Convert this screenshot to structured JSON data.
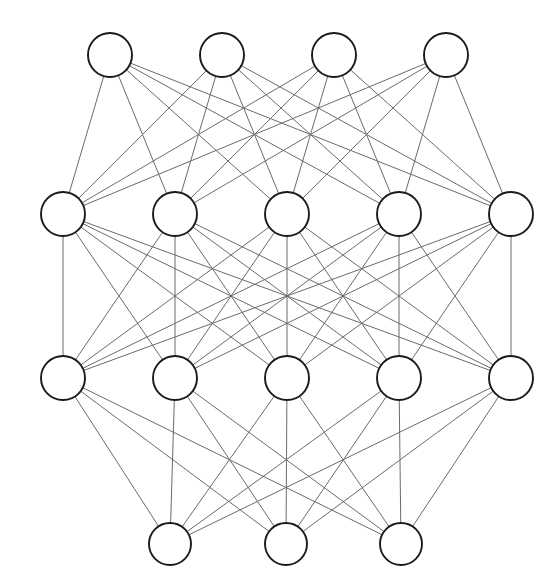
{
  "diagram": {
    "type": "neural-network-graph",
    "canvas": {
      "width": 560,
      "height": 588,
      "background": "#ffffff"
    },
    "style": {
      "node_fill": "#ffffff",
      "node_stroke": "#1a1a1a",
      "node_stroke_width": 1.9,
      "edge_stroke": "#6b6b6b",
      "edge_stroke_width": 1
    },
    "layers": [
      {
        "name": "layer-1",
        "role": "top-layer",
        "node_count": 4,
        "y": 55,
        "radius": 22,
        "nodes": [
          {
            "id": "L1N1",
            "label": "",
            "cx": 110,
            "cy": 55
          },
          {
            "id": "L1N2",
            "label": "",
            "cx": 222,
            "cy": 55
          },
          {
            "id": "L1N3",
            "label": "",
            "cx": 334,
            "cy": 55
          },
          {
            "id": "L1N4",
            "label": "",
            "cx": 446,
            "cy": 55
          }
        ]
      },
      {
        "name": "layer-2",
        "role": "hidden-layer-1",
        "node_count": 5,
        "y": 214,
        "radius": 22,
        "nodes": [
          {
            "id": "L2N1",
            "label": "",
            "cx": 63,
            "cy": 214
          },
          {
            "id": "L2N2",
            "label": "",
            "cx": 175,
            "cy": 214
          },
          {
            "id": "L2N3",
            "label": "",
            "cx": 287,
            "cy": 214
          },
          {
            "id": "L2N4",
            "label": "",
            "cx": 399,
            "cy": 214
          },
          {
            "id": "L2N5",
            "label": "",
            "cx": 511,
            "cy": 214
          }
        ]
      },
      {
        "name": "layer-3",
        "role": "hidden-layer-2",
        "node_count": 5,
        "y": 378,
        "radius": 22,
        "nodes": [
          {
            "id": "L3N1",
            "label": "",
            "cx": 63,
            "cy": 378
          },
          {
            "id": "L3N2",
            "label": "",
            "cx": 175,
            "cy": 378
          },
          {
            "id": "L3N3",
            "label": "",
            "cx": 287,
            "cy": 378
          },
          {
            "id": "L3N4",
            "label": "",
            "cx": 399,
            "cy": 378
          },
          {
            "id": "L3N5",
            "label": "",
            "cx": 511,
            "cy": 378
          }
        ]
      },
      {
        "name": "layer-4",
        "role": "bottom-layer",
        "node_count": 3,
        "y": 544,
        "radius": 21,
        "nodes": [
          {
            "id": "L4N1",
            "label": "",
            "cx": 170,
            "cy": 544
          },
          {
            "id": "L4N2",
            "label": "",
            "cx": 286,
            "cy": 544
          },
          {
            "id": "L4N3",
            "label": "",
            "cx": 401,
            "cy": 544
          }
        ]
      }
    ],
    "connections": [
      {
        "from_layer": "layer-1",
        "to_layer": "layer-2",
        "pattern": "fully-connected",
        "edge_count": 20
      },
      {
        "from_layer": "layer-2",
        "to_layer": "layer-3",
        "pattern": "fully-connected",
        "edge_count": 25
      },
      {
        "from_layer": "layer-3",
        "to_layer": "layer-4",
        "pattern": "fully-connected",
        "edge_count": 15
      }
    ]
  }
}
